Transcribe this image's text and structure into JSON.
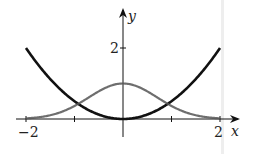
{
  "chart_data": {
    "type": "line",
    "title": "",
    "xlabel": "x",
    "ylabel": "y",
    "xlim": [
      -2,
      2
    ],
    "ylim": [
      0,
      2
    ],
    "x_ticks": [
      -2,
      -1,
      1,
      2
    ],
    "x_tick_labels": [
      "-2",
      "",
      "",
      "2"
    ],
    "y_ticks": [
      2
    ],
    "y_tick_labels": [
      "2"
    ],
    "grid": false,
    "legend": null,
    "series": [
      {
        "name": "parabola",
        "formula": "y = x^2 / 2",
        "style": "solid black, thick",
        "color": "#111111",
        "x": [
          -2,
          -1.5,
          -1,
          -0.5,
          0,
          0.5,
          1,
          1.5,
          2
        ],
        "y": [
          2,
          1.125,
          0.5,
          0.125,
          0,
          0.125,
          0.5,
          1.125,
          2
        ]
      },
      {
        "name": "bell-curve",
        "formula": "y = e^(-x^2)",
        "style": "gray stippled",
        "color": "#555555",
        "x": [
          -2,
          -1.5,
          -1,
          -0.5,
          0,
          0.5,
          1,
          1.5,
          2
        ],
        "y": [
          0.018,
          0.105,
          0.368,
          0.779,
          1,
          0.779,
          0.368,
          0.105,
          0.018
        ]
      }
    ]
  },
  "labels": {
    "x_axis": "x",
    "y_axis": "y",
    "x_min": "−2",
    "x_max": "2",
    "y_tick": "2"
  }
}
